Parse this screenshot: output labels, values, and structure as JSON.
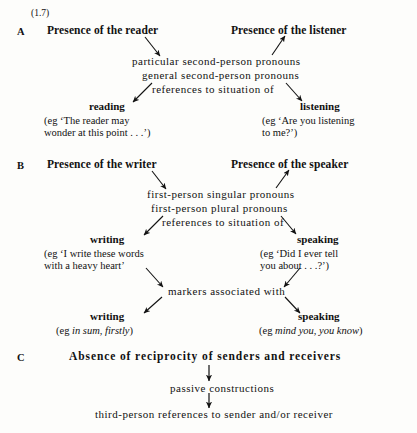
{
  "figure": {
    "number": "(1.7)",
    "background_color": "#fdfdfb",
    "text_color": "#111111"
  },
  "sections": {
    "a": {
      "letter": "A",
      "left_heading": "Presence of the reader",
      "right_heading": "Presence of the listener",
      "middle_lines": [
        "particular  second-person  pronouns",
        "general  second-person  pronouns",
        "references  to  situation  of"
      ],
      "left_outcome": "reading",
      "left_example_line1": "(eg ‘The reader may",
      "left_example_line2": "wonder at this point . . .’)",
      "right_outcome": "listening",
      "right_example_line1": "(eg ‘Are you listening",
      "right_example_line2": "to me?’)"
    },
    "b": {
      "letter": "B",
      "left_heading": "Presence of the writer",
      "right_heading": "Presence of the speaker",
      "middle_lines": [
        "first-person  singular  pronouns",
        "first-person  plural  pronouns",
        "references  to  situation  of"
      ],
      "left_outcome": "writing",
      "left_example_line1": "(eg ‘I write these words",
      "left_example_line2": "with a heavy heart’",
      "right_outcome": "speaking",
      "right_example_line1": "(eg ‘Did I ever tell",
      "right_example_line2": "you about . . .?’)",
      "markers_line": "markers  associated  with",
      "markers_left_outcome": "writing",
      "markers_left_example_prefix": "(eg ",
      "markers_left_example_italic": "in sum, firstly",
      "markers_left_example_suffix": ")",
      "markers_right_outcome": "speaking",
      "markers_right_example_prefix": "(eg ",
      "markers_right_example_italic": "mind you, you know",
      "markers_right_example_suffix": ")"
    },
    "c": {
      "letter": "C",
      "heading": "Absence of reciprocity of senders and receivers",
      "line1": "passive  constructions",
      "line2": "third-person  references  to  sender  and/or  receiver"
    }
  }
}
